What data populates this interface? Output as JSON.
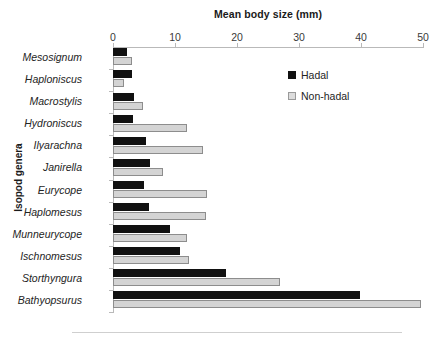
{
  "chart_data": {
    "type": "bar",
    "orientation": "horizontal",
    "title": "",
    "xlabel": "Mean body size (mm)",
    "ylabel": "Isopod genera",
    "xlim": [
      0,
      50
    ],
    "xticks": [
      0,
      10,
      20,
      30,
      40,
      50
    ],
    "xtick_labels": [
      "0",
      "10",
      "20",
      "30",
      "40",
      "50"
    ],
    "grid": false,
    "legend_position": "top-right",
    "categories": [
      "Mesosignum",
      "Haploniscus",
      "Macrostylis",
      "Hydroniscus",
      "Ilyarachna",
      "Janirella",
      "Eurycope",
      "Haplomesus",
      "Munneurycope",
      "Ischnomesus",
      "Storthyngura",
      "Bathyopsurus"
    ],
    "series": [
      {
        "name": "Hadal",
        "color": "#111111",
        "values": [
          2.2,
          3.0,
          3.4,
          3.3,
          5.3,
          5.9,
          5.0,
          5.8,
          9.2,
          10.8,
          18.3,
          39.8
        ]
      },
      {
        "name": "Non-hadal",
        "color": "#d4d4d4",
        "values": [
          3.0,
          1.8,
          4.8,
          12.0,
          14.5,
          8.0,
          15.1,
          15.0,
          12.0,
          12.3,
          26.9,
          49.7
        ]
      }
    ]
  }
}
